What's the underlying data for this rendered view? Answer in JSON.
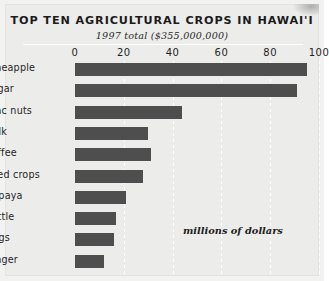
{
  "chart_data": {
    "type": "bar",
    "orientation": "horizontal",
    "title": "TOP TEN AGRICULTURAL CROPS IN HAWAI'I",
    "subtitle": "1997 total ($355,000,000)",
    "annotation": "millions of dollars",
    "xlabel": "",
    "ylabel": "",
    "xlim": [
      0,
      100
    ],
    "xticks": [
      0,
      20,
      40,
      60,
      80,
      100
    ],
    "xtick_labels": [
      "0",
      "20",
      "40",
      "60",
      "80",
      "100"
    ],
    "grid": true,
    "legend": "none",
    "bar_color": "#4e4e4e",
    "background_color": "#ececeb",
    "categories": [
      "pineapple",
      "sugar",
      "mac  nuts",
      "milk",
      "coffee",
      "seed crops",
      "papaya",
      "cattle",
      "eggs",
      "ginger"
    ],
    "values": [
      95,
      91,
      44,
      30,
      31,
      28,
      21,
      17,
      16,
      12
    ]
  }
}
